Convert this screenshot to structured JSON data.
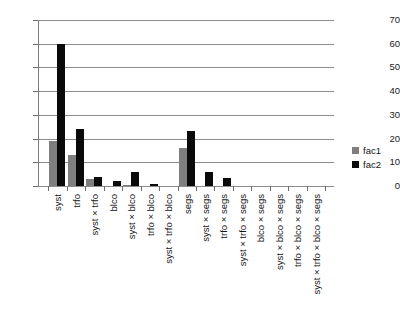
{
  "chart_data": {
    "type": "bar",
    "title": "",
    "subtitle": "",
    "xlabel": "",
    "ylabel": "",
    "ylim": [
      0,
      70
    ],
    "yticks": [
      0,
      10,
      20,
      30,
      40,
      50,
      60,
      70
    ],
    "grid": true,
    "legend_position": "right",
    "categories": [
      "syst",
      "trfo",
      "syst × trfo",
      "blco",
      "syst × blco",
      "trfo × blco",
      "syst × trfo × blco",
      "segs",
      "syst × segs",
      "trfo × segs",
      "syst × trfo × segs",
      "blco × segs",
      "syst × blco × segs",
      "trfo × blco × segs",
      "syst × trfo × blco × segs"
    ],
    "series": [
      {
        "name": "fac1",
        "color": "#7f7f7f",
        "values": [
          19,
          13,
          3,
          0,
          0.6,
          0,
          0,
          16,
          0,
          0,
          0,
          0,
          0,
          0,
          0
        ]
      },
      {
        "name": "fac2",
        "color": "#0a0a0a",
        "values": [
          60,
          24,
          4,
          2,
          6,
          1,
          0,
          23,
          6,
          3.5,
          0,
          0,
          0,
          0,
          0
        ]
      }
    ]
  },
  "legend": {
    "entries": [
      {
        "label": "fac1"
      },
      {
        "label": "fac2"
      }
    ]
  },
  "colors": {
    "fac1": "#7f7f7f",
    "fac2": "#0a0a0a",
    "gridline": "#8d8d8d",
    "axis": "#6e6e6e",
    "text": "#141414",
    "background": "#ffffff"
  }
}
